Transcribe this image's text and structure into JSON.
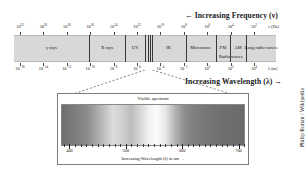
{
  "figure": {
    "credit": "Philip Ronan / Wikipedia",
    "frequency_arrow_label": "← Increasing Frequency (ν)",
    "wavelength_arrow_label": "Increasing Wavelength (λ) →",
    "frequency_unit": "ν (Hz)",
    "wavelength_unit": "λ (m)"
  },
  "chart_data": {
    "type": "bar",
    "xlabel": "Increasing Wavelength (λ) →",
    "ylabel": "",
    "grid": false,
    "legend": "none",
    "frequency_axis": {
      "label": "← Increasing Frequency (ν)",
      "unit": "ν (Hz)",
      "exponents": [
        22,
        20,
        18,
        16,
        14,
        12,
        10,
        8,
        6,
        4,
        2
      ],
      "tick_labels": [
        "10^22",
        "10^20",
        "10^18",
        "10^16",
        "10^14",
        "10^12",
        "10^10",
        "10^8",
        "10^6",
        "10^4",
        "10^2"
      ]
    },
    "wavelength_axis": {
      "label": "Increasing Wavelength (λ) →",
      "unit": "λ (m)",
      "exponents": [
        -16,
        -14,
        -12,
        -10,
        -8,
        -6,
        -4,
        -2,
        0,
        2,
        4
      ],
      "tick_labels": [
        "10^-16",
        "10^-14",
        "10^-12",
        "10^-10",
        "10^-8",
        "10^-6",
        "10^-4",
        "10^-2",
        "10^0",
        "10^2",
        "10^4"
      ]
    },
    "bands": [
      {
        "name": "γ rays",
        "start_pct": 0.0,
        "end_pct": 28.5,
        "row": 1
      },
      {
        "name": "X rays",
        "start_pct": 28.5,
        "end_pct": 42.5,
        "row": 1
      },
      {
        "name": "UV",
        "start_pct": 42.5,
        "end_pct": 50.0,
        "row": 1
      },
      {
        "name": "IR",
        "start_pct": 52.5,
        "end_pct": 65.5,
        "row": 1
      },
      {
        "name": "Microwave",
        "start_pct": 65.5,
        "end_pct": 77.0,
        "row": 1
      },
      {
        "name": "FM",
        "start_pct": 77.0,
        "end_pct": 82.5,
        "row": 1
      },
      {
        "name": "AM",
        "start_pct": 82.5,
        "end_pct": 88.5,
        "row": 1
      },
      {
        "name": "Long radio waves",
        "start_pct": 88.5,
        "end_pct": 100.0,
        "row": 1
      },
      {
        "name": "Radio waves",
        "start_pct": 77.0,
        "end_pct": 88.5,
        "row": 2
      }
    ],
    "dividers_pct": [
      28.5,
      42.5,
      50.0,
      51.3,
      52.0,
      52.8,
      65.5,
      77.0,
      82.5,
      88.5
    ],
    "visible_callout": {
      "title": "Visible spectrum",
      "caption": "Increasing Wavelength (λ) in nm →",
      "tick_labels": [
        "400",
        "500",
        "600",
        "700"
      ],
      "tick_values": [
        400,
        500,
        600,
        700
      ],
      "range_nm": [
        390,
        710
      ],
      "source_band_pct": [
        50.0,
        52.8
      ]
    }
  }
}
